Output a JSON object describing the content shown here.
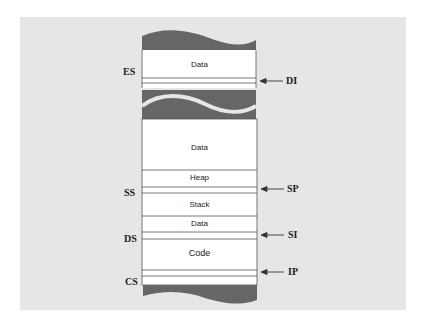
{
  "diagram": {
    "title": "",
    "colors": {
      "background_panel": "#e6e6e6",
      "memory_fill": "#ffffff",
      "break_fill": "#666666",
      "line": "#555555"
    },
    "segments": [
      {
        "label": "Data",
        "region": "extra"
      },
      {
        "label": "Data",
        "region": "stack-segment"
      },
      {
        "label": "Heap",
        "region": "stack-segment"
      },
      {
        "label": "Stack",
        "region": "stack-segment"
      },
      {
        "label": "Data",
        "region": "data-segment"
      },
      {
        "label": "Code",
        "region": "code-segment"
      }
    ],
    "segment_registers": [
      {
        "label": "ES"
      },
      {
        "label": "SS"
      },
      {
        "label": "DS"
      },
      {
        "label": "CS"
      }
    ],
    "pointer_registers": [
      {
        "label": "DI"
      },
      {
        "label": "SP"
      },
      {
        "label": "SI"
      },
      {
        "label": "IP"
      }
    ]
  }
}
